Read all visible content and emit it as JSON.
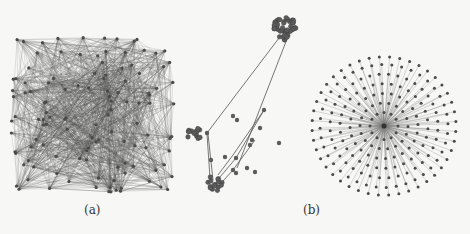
{
  "figure": {
    "background": "#f7f7f5",
    "ink_color": "#4a4a4a",
    "edge_color": "#555555",
    "panels": [
      {
        "id": "dense-graph",
        "description": "dense random graph, square layout",
        "box": {
          "x": 14,
          "y": 40,
          "w": 158,
          "h": 150
        },
        "node_count": 120,
        "edge_count": 1400
      },
      {
        "id": "clustered-graph",
        "description": "graph of dense clusters connected by long edges",
        "box": {
          "x": 180,
          "y": 0,
          "w": 130,
          "h": 200
        },
        "clusters": [
          {
            "cx": 285,
            "cy": 28,
            "r": 12,
            "nodes": 45
          },
          {
            "cx": 194,
            "cy": 134,
            "r": 7,
            "nodes": 14
          },
          {
            "cx": 215,
            "cy": 183,
            "r": 8,
            "nodes": 16
          }
        ],
        "bridge_nodes": [
          [
            207,
            133
          ],
          [
            264,
            110
          ],
          [
            260,
            128
          ],
          [
            252,
            140
          ],
          [
            250,
            145
          ],
          [
            236,
            158
          ],
          [
            247,
            168
          ],
          [
            255,
            172
          ],
          [
            211,
            160
          ],
          [
            225,
            157
          ],
          [
            233,
            170
          ],
          [
            236,
            173
          ]
        ],
        "isolated_nodes": [
          [
            233,
            116
          ],
          [
            237,
            120
          ],
          [
            279,
            143
          ]
        ]
      },
      {
        "id": "star-graph",
        "description": "star graph with central hub and radial leaves",
        "box": {
          "x": 312,
          "y": 55,
          "w": 156,
          "h": 145
        },
        "hub": {
          "cx": 384,
          "cy": 126
        },
        "rings": [
          {
            "r": 14,
            "n": 12
          },
          {
            "r": 24,
            "n": 18
          },
          {
            "r": 34,
            "n": 24
          },
          {
            "r": 44,
            "n": 30
          },
          {
            "r": 54,
            "n": 36
          },
          {
            "r": 64,
            "n": 40
          },
          {
            "r": 72,
            "n": 44
          }
        ]
      }
    ],
    "subfigure_labels": [
      {
        "text": "(a)",
        "x": 84,
        "y": 203
      },
      {
        "text": "(b)",
        "x": 303,
        "y": 203
      }
    ]
  }
}
